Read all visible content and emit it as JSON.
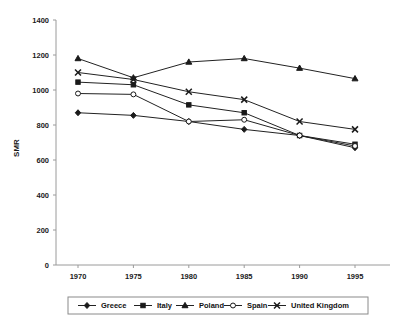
{
  "chart_data": {
    "type": "line",
    "title": "",
    "xlabel": "",
    "ylabel": "SMR",
    "x": [
      1970,
      1975,
      1980,
      1985,
      1990,
      1995
    ],
    "categories": [
      "1970",
      "1975",
      "1980",
      "1985",
      "1990",
      "1995"
    ],
    "ylim": [
      0,
      1400
    ],
    "yticks": [
      0,
      200,
      400,
      600,
      800,
      1000,
      1200,
      1400
    ],
    "ytick_labels": [
      "0",
      "200",
      "400",
      "600",
      "800",
      "1000",
      "1200",
      "1400"
    ],
    "grid": false,
    "legend_position": "bottom",
    "series": [
      {
        "name": "Greece",
        "marker": "diamond",
        "marker_fill": "filled",
        "values": [
          870,
          855,
          820,
          775,
          740,
          670
        ]
      },
      {
        "name": "Italy",
        "marker": "square",
        "marker_fill": "filled",
        "values": [
          1045,
          1030,
          915,
          870,
          740,
          690
        ]
      },
      {
        "name": "Poland",
        "marker": "triangle",
        "marker_fill": "filled",
        "values": [
          1180,
          1070,
          1160,
          1180,
          1125,
          1065
        ]
      },
      {
        "name": "Spain",
        "marker": "circle",
        "marker_fill": "hollow",
        "values": [
          980,
          975,
          820,
          830,
          740,
          680
        ]
      },
      {
        "name": "United Kingdom",
        "marker": "cross",
        "marker_fill": "filled",
        "values": [
          1100,
          1060,
          990,
          945,
          820,
          775
        ]
      }
    ]
  },
  "colors": {
    "line": "#222222",
    "axis": "#9a9a9a",
    "text": "#1a1a1a",
    "background": "#ffffff",
    "legend_border": "#8a8a8a"
  }
}
